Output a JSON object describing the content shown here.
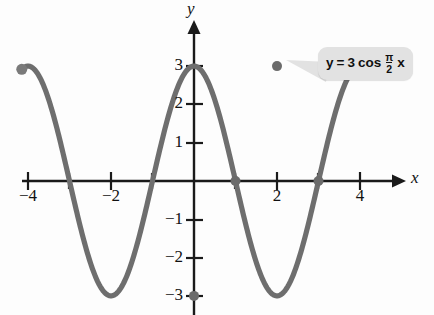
{
  "figure": {
    "background_color": "#fdfdfd",
    "curve_color": "#6e6e6e",
    "axis_color": "#1a1a1a",
    "callout_bg_color": "#e2e2e2"
  },
  "axes": {
    "x_label": "x",
    "y_label": "y",
    "x_ticks": [
      {
        "value": -4,
        "label": "−4",
        "show_label": true
      },
      {
        "value": -3,
        "label": "",
        "show_label": false
      },
      {
        "value": -2,
        "label": "−2",
        "show_label": true
      },
      {
        "value": -1,
        "label": "",
        "show_label": false
      },
      {
        "value": 1,
        "label": "",
        "show_label": false
      },
      {
        "value": 2,
        "label": "2",
        "show_label": true
      },
      {
        "value": 3,
        "label": "",
        "show_label": false
      },
      {
        "value": 4,
        "label": "4",
        "show_label": true
      }
    ],
    "y_ticks": [
      {
        "value": 3,
        "label": "3",
        "show_label": true
      },
      {
        "value": 2,
        "label": "2",
        "show_label": true
      },
      {
        "value": 1,
        "label": "1",
        "show_label": true
      },
      {
        "value": -1,
        "label": "−1",
        "show_label": true
      },
      {
        "value": -2,
        "label": "−2",
        "show_label": true
      },
      {
        "value": -3,
        "label": "−3",
        "show_label": true
      }
    ]
  },
  "callout": {
    "y_symbol": "y",
    "equals": "=",
    "amplitude": "3",
    "function_name": "cos",
    "numerator": "π",
    "denominator": "2",
    "variable": "x",
    "full_text": "y = 3 cos π/2 x"
  },
  "chart_data": {
    "type": "line",
    "xlabel": "x",
    "ylabel": "y",
    "xlim": [
      -4.15,
      4.15
    ],
    "ylim": [
      -3.3,
      3.3
    ],
    "grid": false,
    "legend": "none",
    "equation": "y = 3 cos((pi/2) x)",
    "amplitude": 3,
    "period": 4,
    "series": [
      {
        "name": "y = 3 cos (pi/2) x",
        "color": "#6e6e6e",
        "x": [
          -4.15,
          -4.0,
          -3.75,
          -3.5,
          -3.25,
          -3.0,
          -2.75,
          -2.5,
          -2.25,
          -2.0,
          -1.75,
          -1.5,
          -1.25,
          -1.0,
          -0.75,
          -0.5,
          -0.25,
          0.0,
          0.25,
          0.5,
          0.75,
          1.0,
          1.25,
          1.5,
          1.75,
          2.0,
          2.25,
          2.5,
          2.75,
          3.0,
          3.25,
          3.5,
          3.75,
          4.0,
          4.15
        ],
        "y": [
          -2.67,
          -3.0,
          -2.77,
          -2.12,
          -1.15,
          0.0,
          1.15,
          2.12,
          2.77,
          3.0,
          2.77,
          2.12,
          1.15,
          0.0,
          -1.15,
          -2.12,
          -2.77,
          -3.0,
          -2.77,
          -2.12,
          -1.15,
          0.0,
          1.15,
          2.12,
          2.77,
          3.0,
          2.77,
          2.12,
          1.15,
          0.0,
          -1.15,
          -2.12,
          -2.77,
          -3.0,
          -2.67
        ]
      }
    ],
    "marked_points": [
      {
        "x": 0,
        "y": -3,
        "kind": "minimum"
      },
      {
        "x": 1,
        "y": 0,
        "kind": "x-intercept"
      },
      {
        "x": 2,
        "y": 3,
        "kind": "maximum"
      },
      {
        "x": 3,
        "y": 0,
        "kind": "x-intercept"
      }
    ],
    "endpoints": [
      {
        "x": -4.15,
        "y": -2.67
      },
      {
        "x": 4.15,
        "y": -2.67
      }
    ],
    "annotations": [
      {
        "text": "y = 3 cos π/2 x",
        "points_to_x": 2,
        "points_to_y": 3
      }
    ]
  }
}
